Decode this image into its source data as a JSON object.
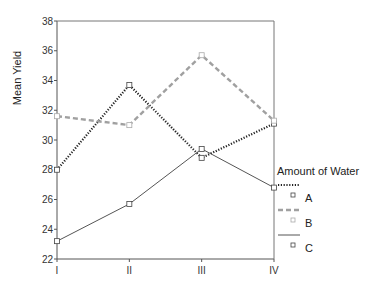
{
  "chart_data": {
    "type": "line",
    "title": "",
    "xlabel": "",
    "ylabel": "Mean Yield",
    "categories": [
      "I",
      "II",
      "III",
      "IV"
    ],
    "ylim": [
      22,
      38
    ],
    "yticks": [
      "22",
      "24",
      "26",
      "28",
      "30",
      "32",
      "34",
      "36",
      "38"
    ],
    "grid": false,
    "legend": {
      "title": "Amount of Water",
      "placement": "right"
    },
    "series": [
      {
        "name": "A",
        "style": "dotted",
        "color": "#222222",
        "values": [
          28.0,
          33.7,
          28.8,
          31.1
        ]
      },
      {
        "name": "B",
        "style": "dashed",
        "color": "#a0a0a0",
        "values": [
          31.6,
          31.0,
          35.7,
          31.3
        ]
      },
      {
        "name": "C",
        "style": "solid",
        "color": "#555555",
        "values": [
          23.2,
          25.7,
          29.4,
          26.8
        ]
      }
    ]
  }
}
